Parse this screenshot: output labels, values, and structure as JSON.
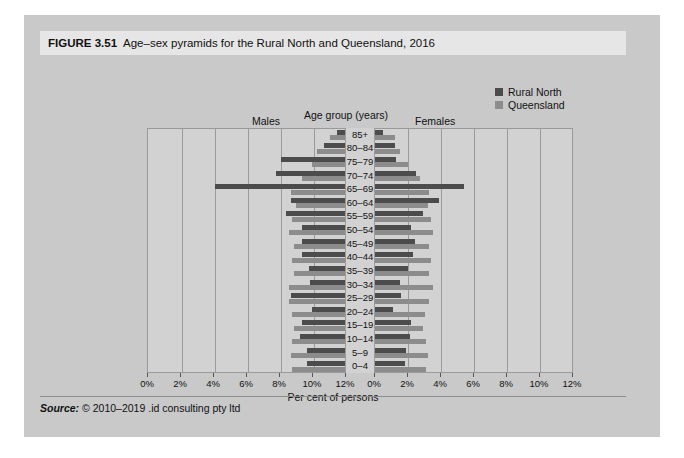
{
  "figure": {
    "number": "FIGURE 3.51",
    "title": "Age–sex pyramids for the Rural North and Queensland, 2016",
    "source_label": "Source:",
    "source_text": "© 2010–2019 .id consulting pty ltd"
  },
  "legend": {
    "position": "top-right",
    "items": [
      {
        "label": "Rural North",
        "color": "#4c4c4c"
      },
      {
        "label": "Queensland",
        "color": "#8c8c8c"
      }
    ]
  },
  "labels": {
    "males": "Males",
    "females": "Females",
    "age_group": "Age group (years)",
    "xaxis_title": "Per cent of persons"
  },
  "colors": {
    "rural_north": "#4c4c4c",
    "queensland": "#8c8c8c",
    "panel_background": "#d2d2d2",
    "gridline": "#9a9a9a",
    "card_background": "#c9c9c9",
    "header_background": "#e6e6e6"
  },
  "chart_data": {
    "type": "bar",
    "subtype": "population-pyramid",
    "title": "Age–sex pyramids for the Rural North and Queensland, 2016",
    "xlabel": "Per cent of persons",
    "ylabel": "Age group (years)",
    "grid": true,
    "legend_position": "top-right",
    "xlim": [
      0,
      12
    ],
    "xticks": [
      12,
      10,
      8,
      6,
      4,
      2,
      0
    ],
    "xtick_labels_left": [
      "12%",
      "10%",
      "8%",
      "6%",
      "4%",
      "2%",
      "0%"
    ],
    "xtick_labels_right": [
      "0%",
      "2%",
      "4%",
      "6%",
      "8%",
      "10%",
      "12%"
    ],
    "categories": [
      "85+",
      "80–84",
      "75–79",
      "70–74",
      "65–69",
      "60–64",
      "55–59",
      "50–54",
      "45–49",
      "40–44",
      "35–39",
      "30–34",
      "25–29",
      "20–24",
      "15–19",
      "10–14",
      "5–9",
      "0–4"
    ],
    "panels": [
      {
        "name": "Males",
        "direction": "left",
        "series": [
          {
            "name": "Rural North",
            "color": "#4c4c4c",
            "values": [
              0.5,
              1.3,
              3.9,
              4.2,
              7.9,
              3.3,
              3.6,
              2.6,
              2.6,
              2.6,
              2.2,
              2.1,
              3.3,
              2.0,
              2.6,
              2.7,
              2.3,
              2.3
            ]
          },
          {
            "name": "Queensland",
            "color": "#8c8c8c",
            "values": [
              0.9,
              1.7,
              2.0,
              2.6,
              3.3,
              3.0,
              3.2,
              3.4,
              3.1,
              3.2,
              3.1,
              3.4,
              3.4,
              3.2,
              3.1,
              3.2,
              3.3,
              3.2
            ]
          }
        ]
      },
      {
        "name": "Females",
        "direction": "right",
        "series": [
          {
            "name": "Rural North",
            "color": "#4c4c4c",
            "values": [
              0.5,
              1.2,
              1.3,
              2.5,
              5.4,
              3.9,
              2.9,
              2.2,
              2.4,
              2.3,
              2.0,
              1.5,
              1.6,
              1.1,
              2.2,
              2.1,
              1.9,
              1.8
            ]
          },
          {
            "name": "Queensland",
            "color": "#8c8c8c",
            "values": [
              1.2,
              1.5,
              2.0,
              2.7,
              3.3,
              3.2,
              3.4,
              3.5,
              3.3,
              3.4,
              3.3,
              3.5,
              3.3,
              3.0,
              2.9,
              3.1,
              3.2,
              3.1
            ]
          }
        ]
      }
    ]
  }
}
